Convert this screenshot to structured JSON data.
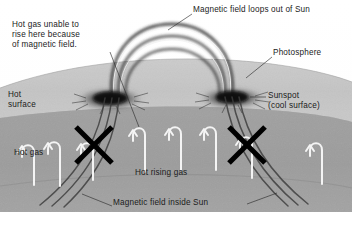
{
  "diagram": {
    "background_color": "#ffffff",
    "palette": {
      "photosphere_light": "#c9c9c9",
      "photosphere_mid": "#b4b4b4",
      "interior_gray": "#9a9a9a",
      "interior_deep": "#8c8c8c",
      "sunspot_dark": "#141414",
      "field_line_dark": "#2a2a2a",
      "convection_arrow_white": "#f4f4f4",
      "x_mark_black": "#000000",
      "label_text": "#1b1b1b",
      "label_text_light": "#f2f2f2"
    }
  },
  "labels": {
    "loops_out_of_sun": "Magnetic field loops out of Sun",
    "hot_gas_unable": "Hot gas unable to\nrise here because\nof magnetic field.",
    "photosphere": "Photosphere",
    "hot_surface": "Hot\nsurface",
    "sunspot": "Sunspot\n(cool surface)",
    "hot_gas": "Hot gas",
    "hot_rising_gas": "Hot rising gas",
    "magnetic_field_inside_sun": "Magnetic field inside Sun"
  },
  "features": {
    "coronal_loops": {
      "count": 3,
      "description": "Three nested arcs of magnetic field looping above the photosphere between the two sunspots"
    },
    "sunspots": {
      "count": 2,
      "left_center_x": 110,
      "right_center_x": 232,
      "center_y": 98,
      "description": "Dark fuzzy cool regions where field lines pierce the surface"
    },
    "x_marks": {
      "count": 2,
      "left_center_x": 94,
      "right_center_x": 247,
      "center_y": 145,
      "description": "Bold X marks indicating suppressed convection beneath each sunspot"
    },
    "convection_arrows": {
      "count": 8,
      "description": "White inverted-U rising-gas arrows inside the Sun"
    },
    "interior_field_lines": {
      "count": 6,
      "description": "Dark field lines bundled under each sunspot curving down into the interior"
    }
  }
}
